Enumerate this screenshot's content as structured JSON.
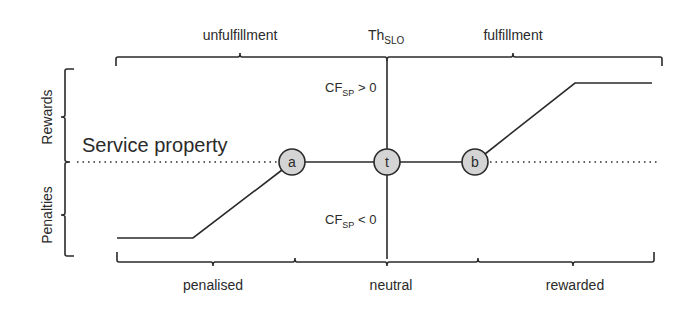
{
  "diagram": {
    "title_left_region": "unfulfillment",
    "threshold": {
      "main": "Th",
      "sub": "SLO"
    },
    "title_right_region": "fulfillment",
    "axis_upper": "Rewards",
    "axis_lower": "Penalties",
    "baseline_label": "Service property",
    "cf_positive": {
      "main": "CF",
      "sub": "SP",
      "rel": " > 0"
    },
    "cf_negative": {
      "main": "CF",
      "sub": "SP",
      "rel": " < 0"
    },
    "nodes": [
      {
        "id": "a",
        "label": "a"
      },
      {
        "id": "t",
        "label": "t"
      },
      {
        "id": "b",
        "label": "b"
      }
    ],
    "bottom_regions": [
      "penalised",
      "neutral",
      "rewarded"
    ],
    "colors": {
      "line": "#2a2a2a",
      "node_fill": "#d4d4d4",
      "background": "#ffffff"
    }
  }
}
